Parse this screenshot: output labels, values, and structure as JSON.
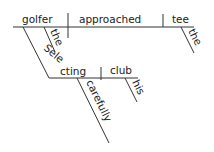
{
  "diagram": {
    "type": "Reed-Kellogg sentence diagram",
    "main_clause": {
      "subject": "golfer",
      "verb": "approached",
      "object": "tee",
      "subject_modifier": "the",
      "object_modifier": "the"
    },
    "participial_phrase": {
      "participle": "Selecting",
      "object": "club",
      "object_modifier": "his",
      "adverb": "carefully"
    }
  }
}
